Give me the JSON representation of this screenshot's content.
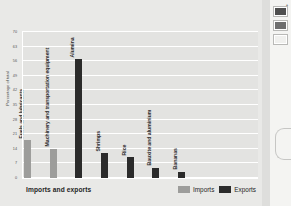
{
  "chart_data": {
    "type": "bar",
    "title": "",
    "subtitle": "",
    "xlabel": "Imports and exports",
    "ylabel": "Percentage of total",
    "ylim": [
      0,
      70
    ],
    "ytick_labels": [
      "0",
      "7",
      "14",
      "21",
      "28",
      "35",
      "42",
      "49",
      "56",
      "63",
      "70"
    ],
    "ytick_values": [
      0,
      7,
      14,
      21,
      28,
      35,
      42,
      49,
      56,
      63,
      70
    ],
    "grid": true,
    "legend_position": "bottom-right",
    "categories": [
      "Fuels and lubricants",
      "Machinery and transportation equipment",
      "Alumina",
      "Shrimps",
      "Rice",
      "Bauxite and aluminium",
      "Bananas"
    ],
    "series": [
      {
        "name": "Imports",
        "color": "#9d9d9b",
        "values": [
          18,
          14,
          0,
          0,
          0,
          0,
          0
        ]
      },
      {
        "name": "Exports",
        "color": "#2b2b2b",
        "values": [
          0,
          0,
          57,
          12,
          10,
          5,
          3
        ]
      }
    ]
  },
  "chart": {
    "y_axis_title": "Percentage of total",
    "x_axis_title": "Imports and exports",
    "y_ticks": [
      "70",
      "63",
      "56",
      "49",
      "42",
      "35",
      "28",
      "21",
      "14",
      "7",
      "0"
    ],
    "categories": [
      {
        "label": "Fuels and lubricants"
      },
      {
        "label": "Machinery and transportation equipment"
      },
      {
        "label": "Alumina"
      },
      {
        "label": "Shrimps"
      },
      {
        "label": "Rice"
      },
      {
        "label": "Bauxite and aluminium"
      },
      {
        "label": "Bananas"
      }
    ],
    "legend": [
      {
        "label": "Imports",
        "color": "#9d9d9b"
      },
      {
        "label": "Exports",
        "color": "#2b2b2b"
      }
    ]
  },
  "side_panel": {
    "tools": [
      {
        "name": "swatch-dark",
        "color": "#4f4f4f"
      },
      {
        "name": "swatch-mid",
        "color": "#6e6e6e"
      },
      {
        "name": "swatch-light",
        "color": "#f0f0ee"
      }
    ],
    "caret": "▴"
  },
  "colors": {
    "background": "#e9e9e7",
    "plot_background": "#e3e3e1",
    "gridline": "#ffffff",
    "imports": "#9d9d9b",
    "exports": "#2b2b2b",
    "text": "#2b2b2b"
  }
}
